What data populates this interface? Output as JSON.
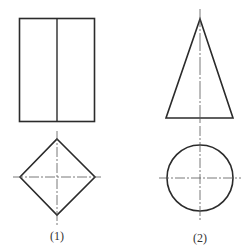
{
  "figures": [
    {
      "label": "(1)",
      "front_view": "rectangle-with-center-line",
      "top_view": "diamond-with-centerlines"
    },
    {
      "label": "(2)",
      "front_view": "isosceles-triangle-with-axis",
      "top_view": "circle-with-centerlines"
    }
  ],
  "colors": {
    "stroke": "#2b2b2b",
    "centerline": "#555555",
    "background": "#ffffff"
  }
}
